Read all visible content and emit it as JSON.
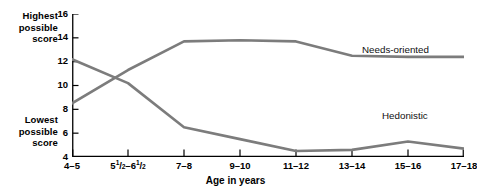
{
  "axis_labels": {
    "highest": "Highest\npossible\nscore",
    "highest_line1": "Highest",
    "highest_line2": "possible",
    "highest_line3": "score",
    "lowest_line1": "Lowest",
    "lowest_line2": "possible",
    "lowest_line3": "score",
    "xaxis_title": "Age in years"
  },
  "colors": {
    "line": "#7c7c7c",
    "axis": "#000000",
    "text": "#000000"
  },
  "chart_data": {
    "type": "line",
    "title": "",
    "subtitle": "",
    "xlabel": "Age in years",
    "ylabel": "",
    "ylabel_top_annotation": "Highest possible score",
    "ylabel_bottom_annotation": "Lowest possible score",
    "categories": [
      "4–5",
      "5½–6½",
      "7–8",
      "9–10",
      "11–12",
      "13–14",
      "15–16",
      "17–18"
    ],
    "categories_display": [
      {
        "plain": "4–5",
        "pre": "4–5",
        "frac1": "",
        "mid": "",
        "frac2": "",
        "post": ""
      },
      {
        "plain": "5½–6½",
        "pre": "5",
        "frac1": "1/2",
        "mid": "–6",
        "frac2": "1/2",
        "post": ""
      },
      {
        "plain": "7–8",
        "pre": "7–8",
        "frac1": "",
        "mid": "",
        "frac2": "",
        "post": ""
      },
      {
        "plain": "9–10",
        "pre": "9–10",
        "frac1": "",
        "mid": "",
        "frac2": "",
        "post": ""
      },
      {
        "plain": "11–12",
        "pre": "11–12",
        "frac1": "",
        "mid": "",
        "frac2": "",
        "post": ""
      },
      {
        "plain": "13–14",
        "pre": "13–14",
        "frac1": "",
        "mid": "",
        "frac2": "",
        "post": ""
      },
      {
        "plain": "15–16",
        "pre": "15–16",
        "frac1": "",
        "mid": "",
        "frac2": "",
        "post": ""
      },
      {
        "plain": "17–18",
        "pre": "17–18",
        "frac1": "",
        "mid": "",
        "frac2": "",
        "post": ""
      }
    ],
    "yticks": [
      16,
      14,
      12,
      10,
      8,
      6,
      4
    ],
    "ytick_labels": [
      "16",
      "14",
      "12",
      "10",
      "8",
      "6",
      "4"
    ],
    "ylim": [
      4,
      16
    ],
    "grid": false,
    "legend": "inline-labels",
    "series": [
      {
        "name": "Needs-oriented",
        "label": "Needs-oriented",
        "color": "#7c7c7c",
        "values": [
          8.5,
          11.3,
          13.7,
          13.8,
          13.7,
          12.5,
          12.4,
          12.4
        ]
      },
      {
        "name": "Hedonistic",
        "label": "Hedonistic",
        "color": "#7c7c7c",
        "values": [
          12.2,
          10.2,
          6.5,
          5.5,
          4.5,
          4.6,
          5.3,
          4.7
        ]
      }
    ],
    "annotations": [
      {
        "text": "Needs-oriented",
        "x_category": "15–16",
        "y": 13.2
      },
      {
        "text": "Hedonistic",
        "x_category": "15–16",
        "y": 6.9
      }
    ]
  }
}
